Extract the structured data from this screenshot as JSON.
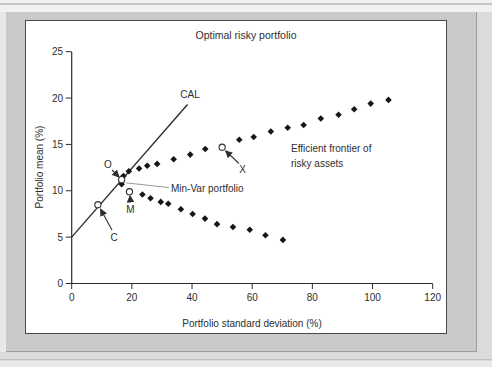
{
  "figure": {
    "title": "Optimal risky portfolio",
    "cal_label": "CAL",
    "frontier_label_line1": "Efficient frontier of",
    "frontier_label_line2": "risky assets",
    "min_var_label": "Min-Var portfolio",
    "point_labels": {
      "o": "O",
      "m": "M",
      "c": "C",
      "x": "X"
    },
    "x_axis_label": "Portfolio standard deviation (%)",
    "y_axis_label": "Portfolio mean (%)"
  },
  "chart_data": {
    "type": "scatter",
    "title": "Optimal risky portfolio",
    "xlabel": "Portfolio standard deviation (%)",
    "ylabel": "Portfolio mean (%)",
    "xlim": [
      0,
      120
    ],
    "ylim": [
      0,
      25
    ],
    "x_ticks": [
      0,
      20,
      40,
      60,
      80,
      100,
      120
    ],
    "y_ticks": [
      0,
      5,
      10,
      15,
      20,
      25
    ],
    "grid": false,
    "legend": false,
    "series": [
      {
        "name": "Efficient frontier of risky assets (upper branch)",
        "marker": "filled-diamond",
        "points": [
          [
            17.2,
            11.6
          ],
          [
            19,
            12.1
          ],
          [
            22.4,
            12.4
          ],
          [
            25.1,
            12.7
          ],
          [
            28.4,
            12.9
          ],
          [
            33.9,
            13.4
          ],
          [
            39.4,
            13.9
          ],
          [
            44.4,
            14.5
          ],
          [
            55.7,
            15.5
          ],
          [
            60.5,
            15.8
          ],
          [
            66.2,
            16.4
          ],
          [
            71.8,
            16.8
          ],
          [
            77.1,
            17.1
          ],
          [
            82.8,
            17.8
          ],
          [
            88.7,
            18.2
          ],
          [
            93.9,
            18.8
          ],
          [
            99.4,
            19.4
          ],
          [
            105.3,
            19.8
          ]
        ]
      },
      {
        "name": "Minimum-variance frontier (lower branch)",
        "marker": "filled-diamond",
        "points": [
          [
            16.6,
            10.7
          ],
          [
            23.5,
            9.6
          ],
          [
            26.2,
            9.2
          ],
          [
            29.6,
            8.8
          ],
          [
            32.1,
            8.6
          ],
          [
            36.3,
            8.0
          ],
          [
            40.2,
            7.5
          ],
          [
            44.3,
            7.0
          ],
          [
            48.3,
            6.4
          ],
          [
            53.6,
            6.1
          ],
          [
            59.2,
            5.8
          ],
          [
            64.4,
            5.2
          ],
          [
            70.2,
            4.7
          ]
        ]
      }
    ],
    "cal_line": {
      "label": "CAL",
      "points": [
        [
          0,
          5
        ],
        [
          38.5,
          19.3
        ]
      ]
    },
    "highlight_points": [
      {
        "label": "O",
        "x": 16.6,
        "y": 11.2,
        "marker": "open-circle"
      },
      {
        "label": "M",
        "x": 19.2,
        "y": 9.9,
        "marker": "open-circle"
      },
      {
        "label": "C",
        "x": 8.7,
        "y": 8.5,
        "marker": "open-circle"
      },
      {
        "label": "X",
        "x": 50.0,
        "y": 14.7,
        "marker": "open-circle"
      }
    ],
    "arrows": [
      {
        "for": "O",
        "from": [
          13.4,
          12.24
        ],
        "to": [
          15.7,
          11.5
        ]
      },
      {
        "for": "M",
        "from": [
          19.55,
          8.74
        ],
        "to": [
          19.4,
          9.45
        ]
      },
      {
        "for": "C",
        "from": [
          13.4,
          5.77
        ],
        "to": [
          9.6,
          8.0
        ]
      },
      {
        "for": "X",
        "from": [
          55.6,
          12.94
        ],
        "to": [
          51.2,
          14.3
        ]
      }
    ],
    "leader_line": {
      "for": "Min-Var portfolio",
      "from": [
        32.3,
        10.35
      ],
      "to": [
        18.2,
        10.85
      ]
    }
  },
  "colors": {
    "ink": "#2e2e2e",
    "marker": "#161616",
    "panel_bg": "#ffffff",
    "panel_border": "#4a4a4a",
    "matte_bg": "#cbcac8",
    "page_bg": "#e9e8e6",
    "leader": "#8f8e8c"
  }
}
